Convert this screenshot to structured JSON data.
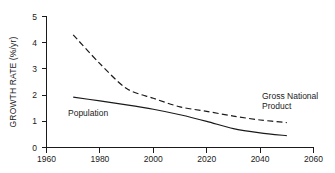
{
  "chart_data": {
    "type": "line",
    "title": "",
    "subtitle": "",
    "xlabel": "",
    "ylabel": "GROWTH RATE (%/yr)",
    "xlim": [
      1960,
      2060
    ],
    "ylim": [
      0,
      5
    ],
    "xticks": [
      1960,
      1980,
      2000,
      2020,
      2040,
      2060
    ],
    "xtick_labels": [
      "1960",
      "1980",
      "2000",
      "2020",
      "2040",
      "2060"
    ],
    "yticks": [
      0,
      1,
      2,
      3,
      4,
      5
    ],
    "ytick_labels": [
      "0",
      "1",
      "2",
      "3",
      "4",
      "5"
    ],
    "grid": false,
    "legend_position": "inline-annotations",
    "series": [
      {
        "name": "Population",
        "style": "solid",
        "color": "#1a1a1a",
        "label_text": "Population",
        "label_x": 1968,
        "label_y": 1.22,
        "x": [
          1970,
          1980,
          1990,
          2000,
          2010,
          2020,
          2030,
          2040,
          2050
        ],
        "values": [
          1.92,
          1.78,
          1.63,
          1.46,
          1.25,
          1.0,
          0.72,
          0.56,
          0.45
        ]
      },
      {
        "name": "Gross National Product",
        "style": "dashed",
        "color": "#1a1a1a",
        "label_text": "Gross National\nProduct",
        "label_line_1": "Gross National",
        "label_line_2": "Product",
        "label_x": 2041,
        "label_y": 2.05,
        "x": [
          1970,
          1980,
          1990,
          2000,
          2010,
          2020,
          2030,
          2040,
          2050
        ],
        "values": [
          4.3,
          3.2,
          2.25,
          1.88,
          1.55,
          1.38,
          1.2,
          1.05,
          0.95
        ]
      }
    ]
  },
  "axes": {
    "y_axis_title": "GROWTH RATE (%/yr)"
  }
}
